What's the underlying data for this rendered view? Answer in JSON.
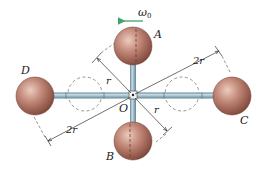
{
  "figure": {
    "angular_velocity_label": "ω",
    "angular_velocity_subscript": "0",
    "labels": {
      "A": "A",
      "B": "B",
      "C": "C",
      "D": "D",
      "O": "O",
      "r_upper": "r",
      "r_lower": "r",
      "two_r_upper": "2r",
      "two_r_lower": "2r"
    },
    "colors": {
      "sphere": "#b8776a",
      "sphere_highlight": "#e7c4b6",
      "sphere_shadow": "#7a4338",
      "rod": "#8fb3c4",
      "rod_dark": "#5f8597",
      "arrow": "#3fa56a",
      "dim_line": "#333333",
      "dashed": "#666666"
    }
  }
}
